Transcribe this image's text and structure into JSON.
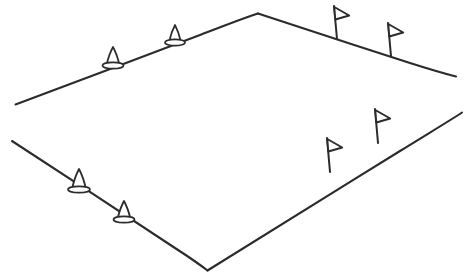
{
  "figure": {
    "background_color": "#ffffff",
    "line_color": "#2b2b2b",
    "cone_fill": "#ffffff",
    "flag_fill": "#ffffff",
    "width": 466,
    "height": 279
  },
  "chart_data": {
    "type": "diagram",
    "xlabel": "",
    "ylabel": "",
    "xlim": [
      0,
      466
    ],
    "ylim": [
      0,
      279
    ],
    "grid": false,
    "legend": "none",
    "field_corners": {
      "left": [
        15,
        104
      ],
      "top": [
        258,
        13
      ],
      "right": [
        456,
        76
      ],
      "bottom_left": [
        12,
        141
      ],
      "bottom": [
        207,
        270
      ],
      "bottom_right": [
        462,
        112
      ]
    },
    "edges": [
      {
        "name": "far-left-edge",
        "points": "15,104 258,13",
        "markers": "cones",
        "marker_count": 2
      },
      {
        "name": "far-right-edge",
        "points": "258,13 456,76",
        "markers": "flags",
        "marker_count": 2
      },
      {
        "name": "near-left-edge",
        "points": "12,141 207,270",
        "markers": "cones",
        "marker_count": 2
      },
      {
        "name": "near-right-edge",
        "points": "207,270 462,112",
        "markers": "flags",
        "marker_count": 2
      }
    ],
    "cones": [
      {
        "id": "cone-1",
        "x": 113,
        "y": 65,
        "height": 18,
        "width": 13,
        "edge": "far-left-edge"
      },
      {
        "id": "cone-2",
        "x": 175,
        "y": 42,
        "height": 17,
        "width": 12,
        "edge": "far-left-edge"
      },
      {
        "id": "cone-3",
        "x": 79,
        "y": 189,
        "height": 20,
        "width": 14,
        "edge": "near-left-edge"
      },
      {
        "id": "cone-4",
        "x": 124,
        "y": 219,
        "height": 18,
        "width": 13,
        "edge": "near-left-edge"
      }
    ],
    "flags": [
      {
        "id": "flag-1",
        "x": 337,
        "y": 39,
        "pole_height": 33,
        "edge": "far-right-edge"
      },
      {
        "id": "flag-2",
        "x": 391,
        "y": 56,
        "pole_height": 33,
        "edge": "far-right-edge"
      },
      {
        "id": "flag-3",
        "x": 330,
        "y": 172,
        "pole_height": 34,
        "edge": "near-right-edge"
      },
      {
        "id": "flag-4",
        "x": 378,
        "y": 143,
        "pole_height": 34,
        "edge": "near-right-edge"
      }
    ],
    "counts": {
      "total_cones": 4,
      "total_flags": 4,
      "total_edges": 4
    }
  }
}
